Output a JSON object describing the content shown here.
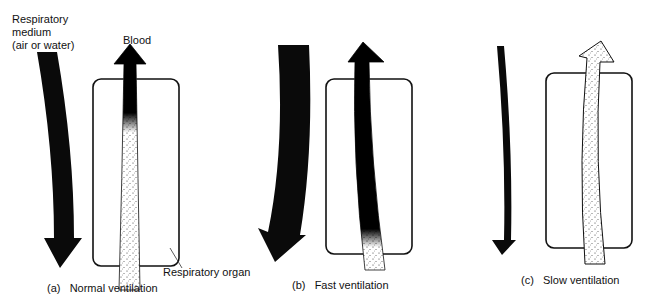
{
  "labels": {
    "medium_line1": "Respiratory",
    "medium_line2": "medium",
    "medium_line3": "(air or water)",
    "blood": "Blood",
    "organ": "Respiratory organ"
  },
  "panels": [
    {
      "letter": "(a)",
      "caption": "Normal ventilation"
    },
    {
      "letter": "(b)",
      "caption": "Fast ventilation"
    },
    {
      "letter": "(c)",
      "caption": "Slow ventilation"
    }
  ],
  "colors": {
    "ink": "#0a0a0a",
    "paper": "#ffffff"
  }
}
